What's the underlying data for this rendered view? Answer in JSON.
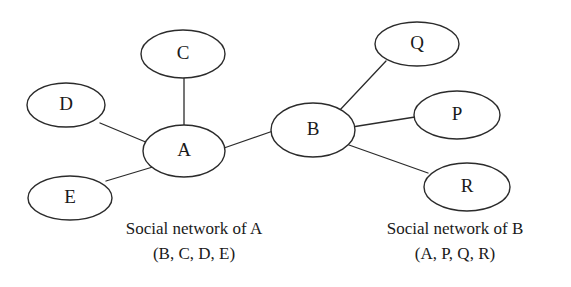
{
  "diagram": {
    "type": "node-link-graph",
    "background_color": "#ffffff",
    "stroke_color": "#2b2b2b",
    "text_color": "#1a1a1a",
    "width": 571,
    "height": 287,
    "nodes": [
      {
        "id": "C",
        "label": "C",
        "cx": 183,
        "cy": 54,
        "rx": 42,
        "ry": 24
      },
      {
        "id": "D",
        "label": "D",
        "cx": 66,
        "cy": 105,
        "rx": 39,
        "ry": 22
      },
      {
        "id": "A",
        "label": "A",
        "cx": 184,
        "cy": 151,
        "rx": 41,
        "ry": 26
      },
      {
        "id": "E",
        "label": "E",
        "cx": 70,
        "cy": 198,
        "rx": 42,
        "ry": 22
      },
      {
        "id": "B",
        "label": "B",
        "cx": 313,
        "cy": 130,
        "rx": 42,
        "ry": 27
      },
      {
        "id": "Q",
        "label": "Q",
        "cx": 417,
        "cy": 44,
        "rx": 42,
        "ry": 22
      },
      {
        "id": "P",
        "label": "P",
        "cx": 457,
        "cy": 115,
        "rx": 43,
        "ry": 24
      },
      {
        "id": "R",
        "label": "R",
        "cx": 467,
        "cy": 187,
        "rx": 43,
        "ry": 24
      }
    ],
    "edges": [
      {
        "id": "edge-c-a",
        "source": "C",
        "target": "A",
        "x1": 184,
        "y1": 78,
        "x2": 184,
        "y2": 125
      },
      {
        "id": "edge-d-a",
        "source": "D",
        "target": "A",
        "x1": 100,
        "y1": 123,
        "x2": 148,
        "y2": 143
      },
      {
        "id": "edge-e-a",
        "source": "E",
        "target": "A",
        "x1": 106,
        "y1": 181,
        "x2": 156,
        "y2": 166
      },
      {
        "id": "edge-a-b",
        "source": "A",
        "target": "B",
        "x1": 224,
        "y1": 148,
        "x2": 273,
        "y2": 131
      },
      {
        "id": "edge-b-q",
        "source": "B",
        "target": "Q",
        "x1": 339,
        "y1": 111,
        "x2": 386,
        "y2": 61
      },
      {
        "id": "edge-b-p",
        "source": "B",
        "target": "P",
        "x1": 352,
        "y1": 127,
        "x2": 415,
        "y2": 117
      },
      {
        "id": "edge-b-r",
        "source": "B",
        "target": "R",
        "x1": 349,
        "y1": 145,
        "x2": 428,
        "y2": 173
      }
    ]
  },
  "captions": {
    "left": {
      "title": "Social network of A",
      "members": "(B, C, D, E)",
      "title_x": 194,
      "title_y": 234,
      "members_x": 194,
      "members_y": 259
    },
    "right": {
      "title": "Social network of B",
      "members": "(A, P, Q, R)",
      "title_x": 455,
      "title_y": 234,
      "members_x": 455,
      "members_y": 259
    }
  }
}
